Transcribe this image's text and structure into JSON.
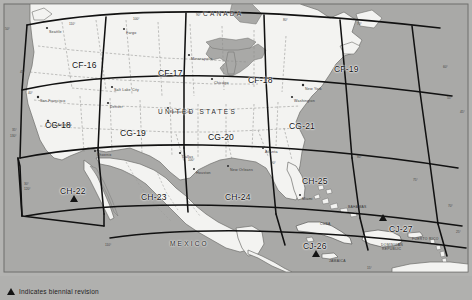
{
  "figure": {
    "background_color": "#b3b3b1",
    "land_color": "#f2f2f0",
    "ocean_color": "#a8a8a6",
    "grid_color": "#111111",
    "state_border_color": "#8a8a88"
  },
  "legend": {
    "marker_icon": "triangle-icon",
    "text": "Indicates biennial revision"
  },
  "country_labels": [
    {
      "name": "CANADA",
      "x": 203,
      "y": 10
    },
    {
      "name": "UNITED STATES",
      "x": 158,
      "y": 108
    },
    {
      "name": "MEXICO",
      "x": 170,
      "y": 240
    }
  ],
  "grid_cells": [
    {
      "id": "CF-16",
      "x": 72,
      "y": 60,
      "biennial": false
    },
    {
      "id": "CF-17",
      "x": 158,
      "y": 68,
      "biennial": false
    },
    {
      "id": "CF-18",
      "x": 248,
      "y": 75,
      "biennial": false
    },
    {
      "id": "CF-19",
      "x": 334,
      "y": 64,
      "biennial": false
    },
    {
      "id": "CG-18",
      "x": 45,
      "y": 120,
      "biennial": false
    },
    {
      "id": "CG-19",
      "x": 120,
      "y": 128,
      "biennial": false
    },
    {
      "id": "CG-20",
      "x": 208,
      "y": 132,
      "biennial": false
    },
    {
      "id": "CG-21",
      "x": 289,
      "y": 121,
      "biennial": false
    },
    {
      "id": "CH-22",
      "x": 60,
      "y": 186,
      "biennial": true
    },
    {
      "id": "CH-23",
      "x": 141,
      "y": 192,
      "biennial": false
    },
    {
      "id": "CH-24",
      "x": 225,
      "y": 192,
      "biennial": false
    },
    {
      "id": "CH-25",
      "x": 302,
      "y": 176,
      "biennial": false
    },
    {
      "id": "CJ-26",
      "x": 303,
      "y": 241,
      "biennial": true
    },
    {
      "id": "CJ-27",
      "x": 389,
      "y": 224,
      "biennial": true
    }
  ],
  "biennial_markers": [
    {
      "cell": "CH-22",
      "x": 70,
      "y": 195
    },
    {
      "cell": "CJ-26",
      "x": 312,
      "y": 250
    },
    {
      "cell": "CJ-27",
      "x": 379,
      "y": 214
    }
  ],
  "island_labels": [
    {
      "name": "CUBA",
      "x": 320,
      "y": 222
    },
    {
      "name": "JAMAICA",
      "x": 329,
      "y": 259
    },
    {
      "name": "DOMINICAN",
      "x": 381,
      "y": 243
    },
    {
      "name": "REPUBLIC",
      "x": 382,
      "y": 247
    },
    {
      "name": "PUERTO RICO",
      "x": 412,
      "y": 237
    },
    {
      "name": "BAHAMAS",
      "x": 348,
      "y": 205
    }
  ],
  "place_labels": [
    {
      "name": "Seattle",
      "x": 49,
      "y": 30
    },
    {
      "name": "Salt Lake City",
      "x": 114,
      "y": 88
    },
    {
      "name": "San Francisco",
      "x": 40,
      "y": 99
    },
    {
      "name": "Los Angeles",
      "x": 50,
      "y": 123
    },
    {
      "name": "Fargo",
      "x": 126,
      "y": 31
    },
    {
      "name": "Minneapolis",
      "x": 191,
      "y": 57
    },
    {
      "name": "Chicago",
      "x": 214,
      "y": 81
    },
    {
      "name": "Denver",
      "x": 110,
      "y": 105
    },
    {
      "name": "Dallas",
      "x": 182,
      "y": 155
    },
    {
      "name": "Houston",
      "x": 196,
      "y": 171
    },
    {
      "name": "New Orleans",
      "x": 230,
      "y": 168
    },
    {
      "name": "Miami",
      "x": 302,
      "y": 197
    },
    {
      "name": "Atlanta",
      "x": 265,
      "y": 150
    },
    {
      "name": "New York",
      "x": 305,
      "y": 87
    },
    {
      "name": "Washington",
      "x": 294,
      "y": 99
    },
    {
      "name": "Phoenix",
      "x": 97,
      "y": 153
    },
    {
      "name": "Kansas City",
      "x": 170,
      "y": 110
    }
  ],
  "coordinate_labels": [
    {
      "text": "50°",
      "x": 5,
      "y": 27
    },
    {
      "text": "45°",
      "x": 20,
      "y": 70
    },
    {
      "text": "40°",
      "x": 28,
      "y": 91
    },
    {
      "text": "35°",
      "x": 12,
      "y": 128
    },
    {
      "text": "130°",
      "x": 10,
      "y": 134
    },
    {
      "text": "30°",
      "x": 24,
      "y": 182
    },
    {
      "text": "120°",
      "x": 24,
      "y": 187
    },
    {
      "text": "110°",
      "x": 105,
      "y": 243
    },
    {
      "text": "100°",
      "x": 188,
      "y": 158
    },
    {
      "text": "90°",
      "x": 271,
      "y": 161
    },
    {
      "text": "80°",
      "x": 357,
      "y": 155
    },
    {
      "text": "75°",
      "x": 413,
      "y": 178
    },
    {
      "text": "70°",
      "x": 448,
      "y": 204
    },
    {
      "text": "25°",
      "x": 456,
      "y": 230
    },
    {
      "text": "15°",
      "x": 367,
      "y": 266
    },
    {
      "text": "60°",
      "x": 443,
      "y": 65
    },
    {
      "text": "70°",
      "x": 357,
      "y": 22
    },
    {
      "text": "80°",
      "x": 283,
      "y": 18
    },
    {
      "text": "90°",
      "x": 196,
      "y": 13
    },
    {
      "text": "100°",
      "x": 133,
      "y": 17
    },
    {
      "text": "110°",
      "x": 69,
      "y": 22
    },
    {
      "text": "45°",
      "x": 460,
      "y": 110
    },
    {
      "text": "55°",
      "x": 447,
      "y": 96
    }
  ]
}
